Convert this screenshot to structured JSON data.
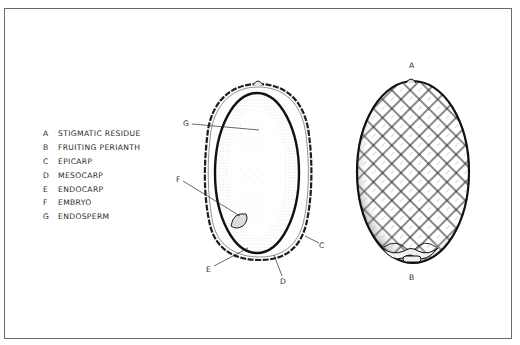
{
  "figure": {
    "legend": [
      {
        "letter": "A",
        "label": "STIGMATIC RESIDUE"
      },
      {
        "letter": "B",
        "label": "FRUITING PERIANTH"
      },
      {
        "letter": "C",
        "label": "EPICARP"
      },
      {
        "letter": "D",
        "label": "MESOCARP"
      },
      {
        "letter": "E",
        "label": "ENDOCARP"
      },
      {
        "letter": "F",
        "label": "EMBRYO"
      },
      {
        "letter": "G",
        "label": "ENDOSPERM"
      }
    ],
    "cross_section_labels": {
      "g": "G",
      "f": "F",
      "c": "C",
      "e": "E",
      "d": "D"
    },
    "whole_fruit_labels": {
      "a": "A",
      "b": "B"
    },
    "colors": {
      "ink": "#1e1e1e",
      "frame": "#6a6a6a",
      "background": "#ffffff"
    }
  }
}
